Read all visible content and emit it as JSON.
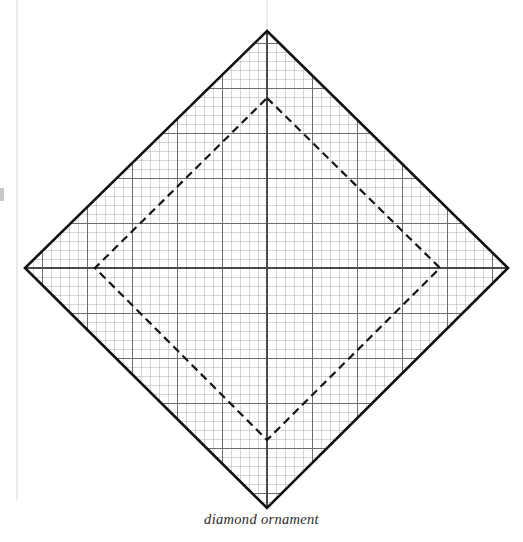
{
  "page": {
    "width": 523,
    "height": 542,
    "background_color": "#ffffff",
    "paper_edge_rule": {
      "name": "page-gutter-rule",
      "x": 17,
      "y_start": 0,
      "y_end": 500,
      "color": "#e2e2e2"
    },
    "top_center_rule": {
      "name": "page-center-rule",
      "x": 267,
      "y_start": 0,
      "y_end": 31,
      "color": "#e0e0e0"
    },
    "edge_artifact": {
      "name": "page-edge-smudge",
      "x": 0,
      "y": 188,
      "width": 4,
      "height": 13,
      "color": "#9a9a9a"
    }
  },
  "figure": {
    "caption": "diamond ornament",
    "caption_color": "#2b2b2b",
    "outer_diamond": {
      "label": "outer diamond outline",
      "stroke_color": "#111111",
      "stroke_width": 2.6,
      "fill": "none",
      "vertices": {
        "top": [
          267,
          31
        ],
        "right": [
          508,
          268
        ],
        "bottom": [
          267,
          508
        ],
        "left": [
          25,
          268
        ]
      }
    },
    "inner_diamond": {
      "label": "inner dashed diamond",
      "stroke_color": "#151515",
      "stroke_width": 2.2,
      "fill": "none",
      "dash_length": 8,
      "dash_gap": 5,
      "vertices": {
        "top": [
          267,
          98
        ],
        "right": [
          440,
          268
        ],
        "bottom": [
          267,
          440
        ],
        "left": [
          95,
          268
        ]
      }
    },
    "grid": {
      "label": "graph paper grid",
      "spacing": 9,
      "major_every": 5,
      "minor_color": "#b9b9b9",
      "minor_width": 0.6,
      "major_color": "#6e6e6e",
      "major_width": 1.0,
      "axis_color": "#4a4a4a",
      "axis_width": 1.3,
      "origin_x": 267,
      "origin_y": 268,
      "clipped_to": "outer_diamond"
    }
  }
}
